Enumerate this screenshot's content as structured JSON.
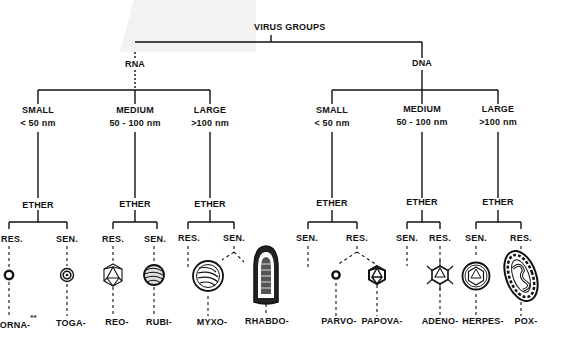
{
  "title": "VIRUS GROUPS",
  "colors": {
    "ink": "#111111",
    "gray_patch": "#f2f2f2",
    "background": "#ffffff"
  },
  "branches": [
    {
      "label": "RNA",
      "sizes": [
        {
          "size": "SMALL",
          "range": "< 50 nm",
          "ether": "ETHER",
          "groups": [
            {
              "sensitivity": "RES.",
              "name": "CORNA-",
              "note": "**",
              "icon": "small-ring-icon"
            },
            {
              "sensitivity": "SEN.",
              "name": "TOGA-",
              "icon": "double-ring-icon"
            }
          ]
        },
        {
          "size": "MEDIUM",
          "range": "50 - 100 nm",
          "ether": "ETHER",
          "groups": [
            {
              "sensitivity": "RES.",
              "name": "REO-",
              "icon": "icosahedron-icon"
            },
            {
              "sensitivity": "SEN.",
              "name": "RUBI-",
              "icon": "striped-sphere-icon"
            }
          ]
        },
        {
          "size": "LARGE",
          "range": ">100 nm",
          "ether": "ETHER",
          "groups": [
            {
              "sensitivity": "RES.",
              "name": "",
              "icon": ""
            },
            {
              "sensitivity": "SEN.",
              "name": "MYXO-",
              "icon": "enveloped-helical-sphere-icon"
            },
            {
              "sensitivity": "SEN.",
              "name": "RHABDO-",
              "icon": "bullet-shape-icon"
            }
          ]
        }
      ]
    },
    {
      "label": "DNA",
      "sizes": [
        {
          "size": "SMALL",
          "range": "< 50 nm",
          "ether": "ETHER",
          "groups": [
            {
              "sensitivity": "SEN.",
              "name": "",
              "icon": ""
            },
            {
              "sensitivity": "RES.",
              "name": "PARVO-",
              "icon": "small-ring-icon"
            },
            {
              "sensitivity": "RES.",
              "name": "PAPOVA-",
              "icon": "icosahedron-icon"
            }
          ]
        },
        {
          "size": "MEDIUM",
          "range": "50 - 100 nm",
          "ether": "ETHER",
          "groups": [
            {
              "sensitivity": "SEN.",
              "name": "",
              "icon": ""
            },
            {
              "sensitivity": "RES.",
              "name": "ADENO-",
              "icon": "icosahedron-with-fibers-icon"
            }
          ]
        },
        {
          "size": "LARGE",
          "range": ">100 nm",
          "ether": "ETHER",
          "groups": [
            {
              "sensitivity": "SEN.",
              "name": "HERPES-",
              "icon": "enveloped-icosahedron-icon"
            },
            {
              "sensitivity": "RES.",
              "name": "POX-",
              "icon": "brick-shape-icon"
            }
          ]
        }
      ]
    }
  ]
}
